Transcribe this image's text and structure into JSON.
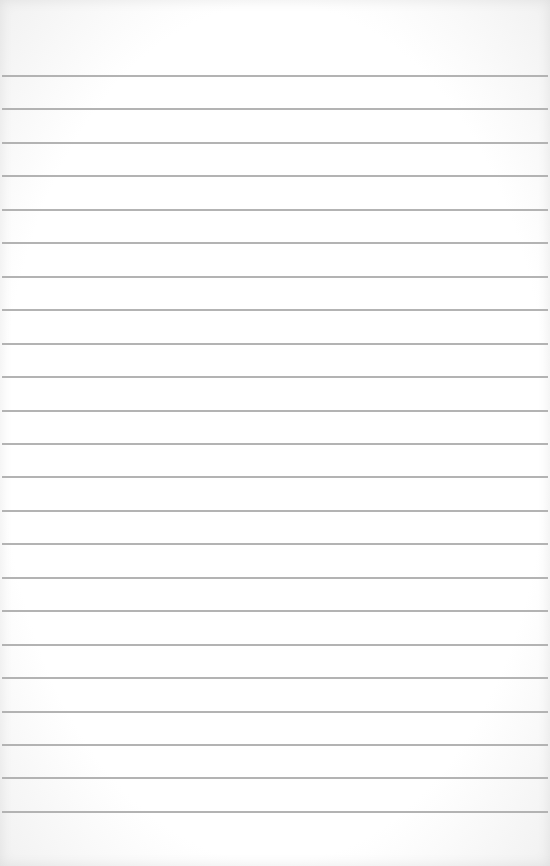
{
  "sheet": {
    "kind": "blank lined paper",
    "paper_color": "#ffffff",
    "line_color": "#b3b3b3",
    "line_count": 23,
    "first_line_y": 75,
    "line_spacing": 33.45,
    "text": ""
  }
}
